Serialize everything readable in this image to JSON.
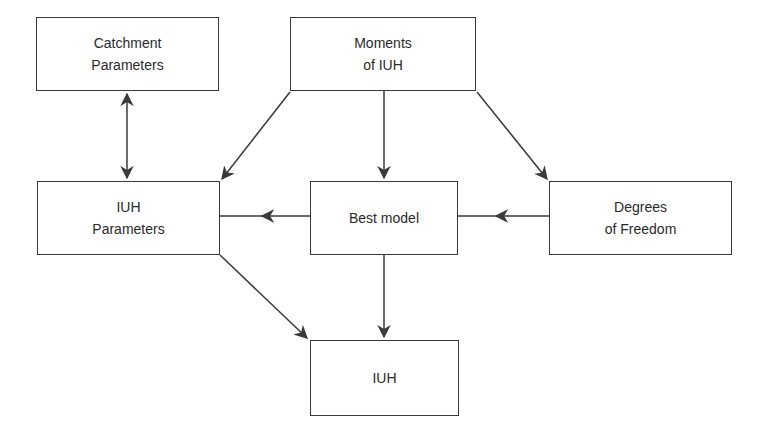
{
  "diagram": {
    "nodes": {
      "catchment": {
        "lines": [
          "Catchment",
          "Parameters"
        ]
      },
      "moments": {
        "lines": [
          "Moments",
          "of IUH"
        ]
      },
      "iuh_params": {
        "lines": [
          "IUH",
          "Parameters"
        ]
      },
      "best_model": {
        "lines": [
          "Best model"
        ]
      },
      "degrees": {
        "lines": [
          "Degrees",
          "of Freedom"
        ]
      },
      "iuh": {
        "lines": [
          "IUH"
        ]
      }
    },
    "edges": [
      {
        "from": "catchment",
        "to": "iuh_params",
        "bidirectional": true
      },
      {
        "from": "moments",
        "to": "iuh_params"
      },
      {
        "from": "moments",
        "to": "best_model"
      },
      {
        "from": "moments",
        "to": "degrees"
      },
      {
        "from": "best_model",
        "to": "iuh_params"
      },
      {
        "from": "degrees",
        "to": "best_model"
      },
      {
        "from": "iuh_params",
        "to": "iuh"
      },
      {
        "from": "best_model",
        "to": "iuh"
      }
    ],
    "colors": {
      "stroke": "#3a3a3a",
      "text": "#2a2a2a"
    }
  }
}
